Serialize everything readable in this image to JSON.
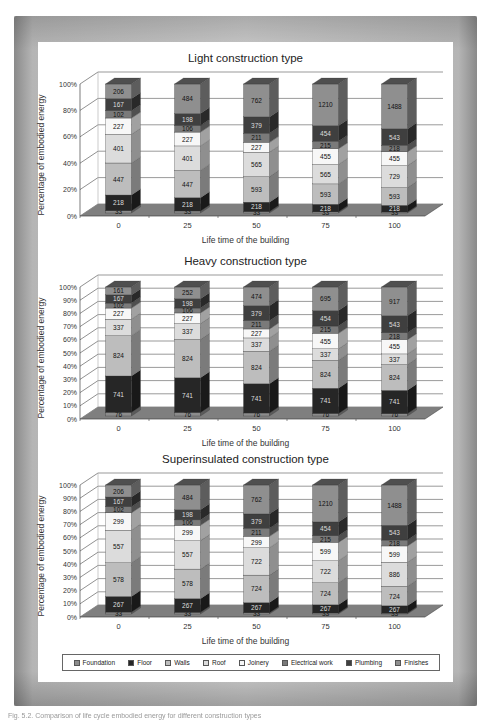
{
  "figure": {
    "legend": [
      {
        "label": "Foundation",
        "color": "#8c8c8c"
      },
      {
        "label": "Floor",
        "color": "#262626"
      },
      {
        "label": "Walls",
        "color": "#bdbdbd"
      },
      {
        "label": "Roof",
        "color": "#dcdcdc"
      },
      {
        "label": "Joinery",
        "color": "#f7f7f7"
      },
      {
        "label": "Electrical work",
        "color": "#7a7a7a"
      },
      {
        "label": "Plumbing",
        "color": "#3f3f3f"
      },
      {
        "label": "Finishes",
        "color": "#8f8f8f"
      }
    ],
    "caption": "Fig. 5.2. Comparison of life cycle embodied energy for different construction types"
  },
  "chart_data": [
    {
      "type": "bar",
      "stacked": true,
      "normalized_percent": true,
      "three_d": true,
      "title": "Light construction type",
      "xlabel": "Life time of the building",
      "ylabel": "Percentage of embodied energy",
      "yticks": [
        "0%",
        "20%",
        "40%",
        "60%",
        "80%",
        "100%"
      ],
      "ylim": [
        0,
        100
      ],
      "grid": true,
      "categories": [
        "0",
        "25",
        "50",
        "75",
        "100"
      ],
      "series": [
        {
          "name": "Foundation",
          "values": [
            33,
            33,
            33,
            33,
            33
          ]
        },
        {
          "name": "Floor",
          "values": [
            218,
            218,
            218,
            218,
            218
          ]
        },
        {
          "name": "Walls",
          "values": [
            447,
            447,
            593,
            593,
            593
          ]
        },
        {
          "name": "Roof",
          "values": [
            401,
            401,
            565,
            565,
            729
          ]
        },
        {
          "name": "Joinery",
          "values": [
            227,
            227,
            227,
            455,
            455
          ]
        },
        {
          "name": "Electrical work",
          "values": [
            102,
            106,
            211,
            215,
            218
          ]
        },
        {
          "name": "Plumbing",
          "values": [
            167,
            198,
            379,
            454,
            543
          ]
        },
        {
          "name": "Finishes",
          "values": [
            206,
            484,
            762,
            1210,
            1488
          ]
        }
      ]
    },
    {
      "type": "bar",
      "stacked": true,
      "normalized_percent": true,
      "three_d": true,
      "title": "Heavy construction type",
      "xlabel": "Life time of the building",
      "ylabel": "Percentage of embodied energy",
      "yticks": [
        "0%",
        "10%",
        "20%",
        "30%",
        "40%",
        "50%",
        "60%",
        "70%",
        "80%",
        "90%",
        "100%"
      ],
      "ylim": [
        0,
        100
      ],
      "grid": true,
      "categories": [
        "0",
        "25",
        "50",
        "75",
        "100"
      ],
      "series": [
        {
          "name": "Foundation",
          "values": [
            76,
            76,
            76,
            76,
            76
          ]
        },
        {
          "name": "Floor",
          "values": [
            741,
            741,
            741,
            741,
            741
          ]
        },
        {
          "name": "Walls",
          "values": [
            824,
            824,
            824,
            824,
            824
          ]
        },
        {
          "name": "Roof",
          "values": [
            337,
            337,
            337,
            337,
            337
          ]
        },
        {
          "name": "Joinery",
          "values": [
            227,
            227,
            227,
            455,
            455
          ]
        },
        {
          "name": "Electrical work",
          "values": [
            102,
            106,
            211,
            215,
            218
          ]
        },
        {
          "name": "Plumbing",
          "values": [
            167,
            198,
            379,
            454,
            543
          ]
        },
        {
          "name": "Finishes",
          "values": [
            161,
            252,
            474,
            695,
            917
          ]
        }
      ]
    },
    {
      "type": "bar",
      "stacked": true,
      "normalized_percent": true,
      "three_d": true,
      "title": "Superinsulated construction type",
      "xlabel": "Life time of the building",
      "ylabel": "Percentage of embodied energy",
      "yticks": [
        "0%",
        "10%",
        "20%",
        "30%",
        "40%",
        "50%",
        "60%",
        "70%",
        "80%",
        "90%",
        "100%"
      ],
      "ylim": [
        0,
        100
      ],
      "grid": true,
      "categories": [
        "0",
        "25",
        "50",
        "75",
        "100"
      ],
      "series": [
        {
          "name": "Foundation",
          "values": [
            33,
            33,
            33,
            33,
            33
          ]
        },
        {
          "name": "Floor",
          "values": [
            267,
            267,
            267,
            267,
            267
          ]
        },
        {
          "name": "Walls",
          "values": [
            578,
            578,
            724,
            724,
            724
          ]
        },
        {
          "name": "Roof",
          "values": [
            557,
            557,
            722,
            722,
            886
          ]
        },
        {
          "name": "Joinery",
          "values": [
            299,
            299,
            299,
            599,
            599
          ]
        },
        {
          "name": "Electrical work",
          "values": [
            102,
            106,
            211,
            215,
            218
          ]
        },
        {
          "name": "Plumbing",
          "values": [
            167,
            198,
            379,
            454,
            543
          ]
        },
        {
          "name": "Finishes",
          "values": [
            206,
            484,
            762,
            1210,
            1488
          ]
        }
      ]
    }
  ]
}
